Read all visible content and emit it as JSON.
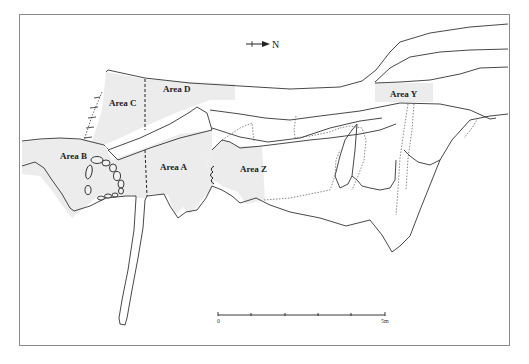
{
  "figure": {
    "type": "archaeological site plan",
    "colors": {
      "line": "#333333",
      "dotted": "#555555",
      "area_fill": "#ececec",
      "frame": "#8a8a8a",
      "background": "#ffffff"
    }
  },
  "north_arrow": {
    "label": "N",
    "direction": "right"
  },
  "areas": [
    {
      "id": "A",
      "label": "Area A"
    },
    {
      "id": "B",
      "label": "Area B"
    },
    {
      "id": "C",
      "label": "Area C"
    },
    {
      "id": "D",
      "label": "Area D"
    },
    {
      "id": "Y",
      "label": "Area Y"
    },
    {
      "id": "Z",
      "label": "Area Z"
    }
  ],
  "scale_bar": {
    "start_label": "0",
    "end_label": "5m",
    "divisions": 5
  }
}
